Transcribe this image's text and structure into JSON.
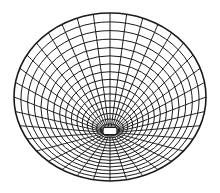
{
  "figure": {
    "description": "Wireframe mesh of an ellipsoid viewed obliquely from below, with a small open hole at the pole",
    "stroke_color": "#1a1a1a",
    "background": "#ffffff",
    "outline": {
      "cx": 110,
      "cy": 97,
      "rx": 96,
      "ry": 84
    },
    "pole": {
      "cx": 110,
      "cy": 131,
      "w": 14,
      "h": 7
    },
    "rings": 16,
    "meridians": 36
  }
}
